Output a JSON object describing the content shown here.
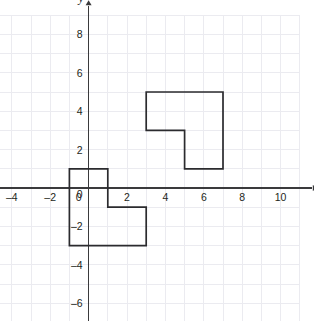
{
  "figure": {
    "title": "",
    "background_color": "#ffffff",
    "grid_color": "#ebebf0",
    "axis_color": "#3a3a3c",
    "shape_stroke_color": "#2b2b2e"
  },
  "axes": {
    "x_axis_name": "x",
    "y_axis_name": "y",
    "x_ticks": [
      "–4",
      "–2",
      "0",
      "2",
      "4",
      "6",
      "8",
      "10"
    ],
    "x_tick_values": [
      -4,
      -2,
      0,
      2,
      4,
      6,
      8,
      10
    ],
    "y_ticks": [
      "8",
      "6",
      "4",
      "2",
      "0",
      "–2",
      "–4",
      "–6"
    ],
    "y_tick_values": [
      8,
      6,
      4,
      2,
      0,
      -2,
      -4,
      -6
    ],
    "x_range": [
      -5,
      11
    ],
    "y_range": [
      -7,
      9
    ],
    "grid_step": 1,
    "tick_step": 2,
    "grid_visible": true,
    "x_arrow": true,
    "y_arrow": true
  },
  "chart_data": {
    "type": "scatter",
    "title": "",
    "xlabel": "x",
    "ylabel": "y",
    "xlim": [
      -5,
      11
    ],
    "ylim": [
      -7,
      9
    ],
    "grid": true,
    "shapes": [
      {
        "name": "upper-right-l-shape",
        "label": "L-shaped polygon (image)",
        "closed": true,
        "vertices": [
          [
            3,
            5
          ],
          [
            7,
            5
          ],
          [
            7,
            1
          ],
          [
            5,
            1
          ],
          [
            5,
            3
          ],
          [
            3,
            3
          ]
        ]
      },
      {
        "name": "lower-left-l-shape",
        "label": "L-shaped polygon (preimage)",
        "closed": true,
        "vertices": [
          [
            -1,
            1
          ],
          [
            1,
            1
          ],
          [
            1,
            -1
          ],
          [
            3,
            -1
          ],
          [
            3,
            -3
          ],
          [
            -1,
            -3
          ]
        ]
      }
    ]
  }
}
